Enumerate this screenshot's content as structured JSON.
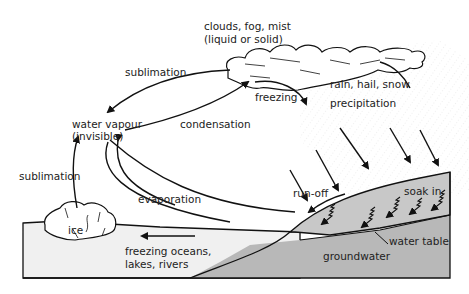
{
  "labels": {
    "clouds": "clouds, fog, mist",
    "clouds_sub": "(liquid or solid)",
    "sublimation_top": "sublimation",
    "water_vapour": "water vapour",
    "water_vapour_sub": "(invisible)",
    "condensation": "condensation",
    "freezing": "freezing",
    "rain": "rain, hail, snow",
    "precipitation": "precipitation",
    "sublimation_left": "sublimation",
    "evaporation": "evaporation",
    "run_off": "run-off",
    "soak_in": "soak in",
    "ice": "ice",
    "freezing_oceans": "freezing oceans,",
    "freezing_oceans_sub": "lakes, rivers",
    "water_table": "water table",
    "groundwater": "groundwater"
  },
  "colors": {
    "line": "#111111",
    "water": "#f0f0f0",
    "ground": "#c4c4c4",
    "groundwater": "#b0b0b0"
  }
}
